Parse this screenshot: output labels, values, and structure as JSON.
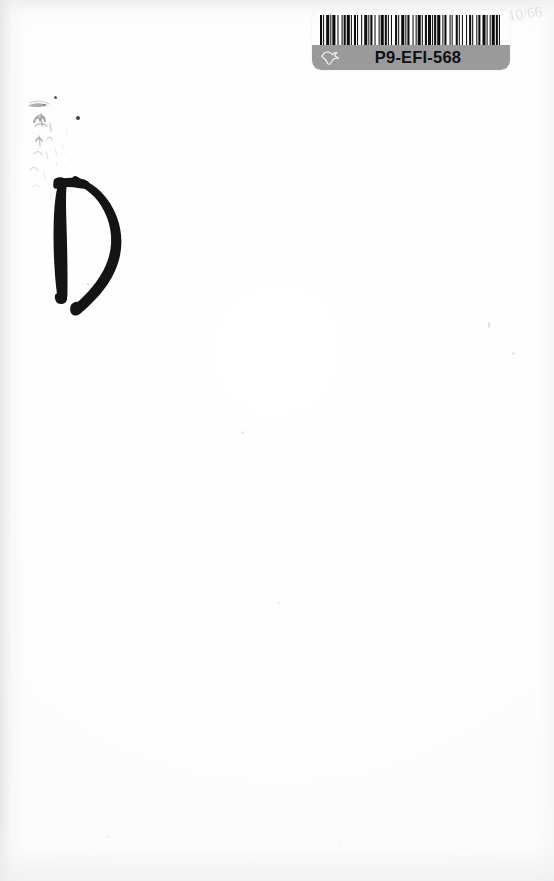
{
  "page": {
    "kind": "scanned-book-page",
    "background_color": "#fefefe",
    "width_px": 554,
    "height_px": 881,
    "content_summary": "Blank scanned page"
  },
  "barcode_label": {
    "code_text": "P9-EFI-568",
    "band_color": "#9a9a9a",
    "label_background": "#fdfdfd",
    "text_color": "#111111",
    "logo_icon": "dove-icon",
    "barcode_icon": "barcode-icon",
    "barcode_widths": [
      2,
      1,
      1,
      2,
      3,
      1,
      1,
      1,
      3,
      2,
      1,
      3,
      1,
      1,
      2,
      1,
      3,
      1,
      1,
      2,
      2,
      1,
      1,
      3,
      1,
      2,
      3,
      1,
      1,
      1,
      2,
      2,
      1,
      3,
      1,
      1,
      3,
      1,
      2,
      1,
      1,
      2,
      1,
      3,
      2,
      1,
      1,
      2,
      3,
      1,
      1,
      1,
      2,
      3,
      1,
      2,
      1,
      1,
      3,
      1,
      1,
      2,
      2,
      1,
      3,
      1,
      1,
      1,
      2,
      1,
      3,
      2,
      1,
      1,
      2,
      3,
      1,
      1,
      1,
      3,
      2,
      1,
      1,
      2,
      1,
      3,
      1,
      2,
      2,
      1,
      1,
      3,
      1,
      1,
      2,
      2,
      3,
      1,
      1,
      2,
      1,
      1,
      3,
      1,
      2,
      1,
      1,
      2
    ]
  },
  "annotations": {
    "marker_letter": "D",
    "marker_letter_color": "#141414",
    "pencil_note": "10/66",
    "pencil_note_color": "#96969b",
    "ink_smudges_label": "faint ink offset smudges"
  }
}
